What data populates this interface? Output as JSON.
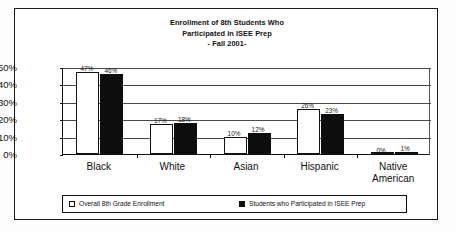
{
  "chart_data": {
    "type": "bar",
    "title": "Enrollment of 8th Students Who Participated in ISEE Prep - Fall 2001-",
    "title_lines": [
      "Enrollment of 8th Students Who",
      "Participated in ISEE Prep",
      "- Fall 2001-"
    ],
    "xlabel": "",
    "ylabel": "",
    "ylim": [
      0,
      50
    ],
    "ytick_labels": [
      "50%",
      "40%",
      "30%",
      "20%",
      "10%",
      "0%"
    ],
    "ytick_values": [
      50,
      40,
      30,
      20,
      10,
      0
    ],
    "grid": "horizontal",
    "legend_position": "bottom",
    "categories": [
      "Black",
      "White",
      "Asian",
      "Hispanic",
      "Native American"
    ],
    "category_lines": [
      [
        "Black"
      ],
      [
        "White"
      ],
      [
        "Asian"
      ],
      [
        "Hispanic"
      ],
      [
        "Native",
        "American"
      ]
    ],
    "series": [
      {
        "name": "Overall 8th Grade Enrollment",
        "values": [
          47,
          17,
          10,
          26,
          0
        ],
        "labels": [
          "47%",
          "17%",
          "10%",
          "26%",
          "0%"
        ],
        "color": "#ffffff",
        "edge_color": "#111111"
      },
      {
        "name": "Students who Participated in ISEE Prep",
        "values": [
          46,
          18,
          12,
          23,
          1
        ],
        "labels": [
          "46%",
          "18%",
          "12%",
          "23%",
          "1%"
        ],
        "color": "#0d0d0d",
        "edge_color": "#0d0d0d"
      }
    ]
  },
  "legend": {
    "entries": [
      {
        "label": "Overall 8th Grade Enrollment",
        "swatch": "hollow"
      },
      {
        "label": "Students who Participated in ISEE Prep",
        "swatch": "filled"
      }
    ]
  }
}
